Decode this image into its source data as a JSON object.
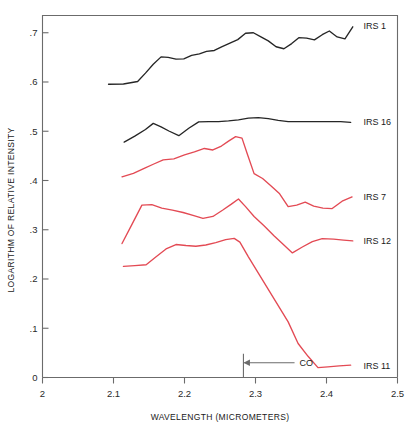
{
  "chart_data": {
    "type": "line",
    "title": "",
    "xlabel": "WAVELENGTH (MICROMETERS)",
    "ylabel": "LOGARITHM OF RELATIVE INTENSITY",
    "xlim": [
      2.0,
      2.5
    ],
    "ylim": [
      0.0,
      0.735
    ],
    "xticks": [
      2.0,
      2.1,
      2.2,
      2.3,
      2.4,
      2.5
    ],
    "xticklabels": [
      "2",
      "2.1",
      "2.2",
      "2.3",
      "2.4",
      "2.5"
    ],
    "yticks": [
      0.0,
      0.1,
      0.2,
      0.3,
      0.4,
      0.5,
      0.6,
      0.7
    ],
    "yticklabels": [
      "0",
      ".1",
      ".2",
      ".3",
      ".4",
      ".5",
      ".6",
      ".7"
    ],
    "grid": false,
    "legend_position": "right-inline",
    "annotations": [
      {
        "name": "co-absorption-marker",
        "label": "CO",
        "x": 2.283,
        "arrow_from_x": 2.355,
        "arrow_to_x": 2.283,
        "y": 0.03,
        "color": "#6b6b6b"
      }
    ],
    "series": [
      {
        "name": "IRS 1",
        "label": "IRS 1",
        "color": "#262626",
        "label_x": 2.452,
        "label_y": 0.714,
        "x": [
          2.093,
          2.114,
          2.134,
          2.145,
          2.156,
          2.167,
          2.177,
          2.188,
          2.199,
          2.21,
          2.221,
          2.231,
          2.242,
          2.253,
          2.264,
          2.275,
          2.286,
          2.297,
          2.307,
          2.318,
          2.329,
          2.34,
          2.351,
          2.361,
          2.372,
          2.383,
          2.394,
          2.404,
          2.415,
          2.426,
          2.437
        ],
        "y": [
          0.5955,
          0.596,
          0.601,
          0.618,
          0.636,
          0.651,
          0.65,
          0.6465,
          0.647,
          0.654,
          0.657,
          0.662,
          0.664,
          0.672,
          0.679,
          0.686,
          0.699,
          0.7,
          0.692,
          0.6835,
          0.6715,
          0.6675,
          0.678,
          0.69,
          0.689,
          0.6855,
          0.696,
          0.7035,
          0.6915,
          0.6875,
          0.712
        ]
      },
      {
        "name": "IRS 16",
        "label": "IRS 16",
        "color": "#262626",
        "label_x": 2.452,
        "label_y": 0.519,
        "x": [
          2.115,
          2.13,
          2.145,
          2.156,
          2.167,
          2.178,
          2.192,
          2.206,
          2.22,
          2.234,
          2.248,
          2.262,
          2.276,
          2.29,
          2.304,
          2.318,
          2.332,
          2.346,
          2.36,
          2.374,
          2.39,
          2.405,
          2.42,
          2.434
        ],
        "y": [
          0.478,
          0.49,
          0.5035,
          0.516,
          0.509,
          0.5005,
          0.491,
          0.506,
          0.519,
          0.5195,
          0.5195,
          0.521,
          0.523,
          0.5265,
          0.5275,
          0.5255,
          0.522,
          0.5195,
          0.5195,
          0.5195,
          0.5195,
          0.5195,
          0.5195,
          0.518
        ]
      },
      {
        "name": "IRS 7",
        "label": "IRS 7",
        "color": "#e34a54",
        "label_x": 2.452,
        "label_y": 0.367,
        "x": [
          2.112,
          2.128,
          2.144,
          2.156,
          2.17,
          2.185,
          2.2,
          2.214,
          2.228,
          2.24,
          2.252,
          2.262,
          2.272,
          2.281,
          2.288,
          2.298,
          2.31,
          2.322,
          2.334,
          2.346,
          2.358,
          2.37,
          2.382,
          2.395,
          2.408,
          2.422,
          2.436
        ],
        "y": [
          0.4075,
          0.4145,
          0.425,
          0.433,
          0.442,
          0.444,
          0.452,
          0.458,
          0.465,
          0.462,
          0.47,
          0.48,
          0.489,
          0.486,
          0.456,
          0.414,
          0.404,
          0.389,
          0.373,
          0.347,
          0.35,
          0.356,
          0.348,
          0.344,
          0.343,
          0.358,
          0.3665
        ]
      },
      {
        "name": "IRS 12",
        "label": "IRS 12",
        "color": "#e34a54",
        "label_x": 2.452,
        "label_y": 0.278,
        "x": [
          2.112,
          2.126,
          2.14,
          2.154,
          2.168,
          2.183,
          2.198,
          2.212,
          2.226,
          2.24,
          2.254,
          2.266,
          2.276,
          2.286,
          2.298,
          2.312,
          2.326,
          2.34,
          2.352,
          2.366,
          2.38,
          2.394,
          2.41,
          2.424,
          2.437
        ],
        "y": [
          0.272,
          0.311,
          0.35,
          0.351,
          0.344,
          0.34,
          0.335,
          0.329,
          0.323,
          0.327,
          0.34,
          0.352,
          0.3625,
          0.347,
          0.327,
          0.308,
          0.288,
          0.269,
          0.253,
          0.265,
          0.276,
          0.282,
          0.281,
          0.279,
          0.2775
        ]
      },
      {
        "name": "IRS 11",
        "label": "IRS 11",
        "color": "#e34a54",
        "label_x": 2.452,
        "label_y": 0.024,
        "x": [
          2.114,
          2.13,
          2.146,
          2.16,
          2.174,
          2.188,
          2.202,
          2.216,
          2.23,
          2.244,
          2.258,
          2.27,
          2.278,
          2.29,
          2.304,
          2.318,
          2.332,
          2.346,
          2.36,
          2.374,
          2.388,
          2.402,
          2.418,
          2.434
        ],
        "y": [
          0.2255,
          0.227,
          0.229,
          0.245,
          0.261,
          0.27,
          0.268,
          0.2665,
          0.269,
          0.274,
          0.28,
          0.2825,
          0.275,
          0.245,
          0.212,
          0.179,
          0.146,
          0.113,
          0.069,
          0.043,
          0.02,
          0.0215,
          0.0235,
          0.025
        ]
      }
    ]
  }
}
